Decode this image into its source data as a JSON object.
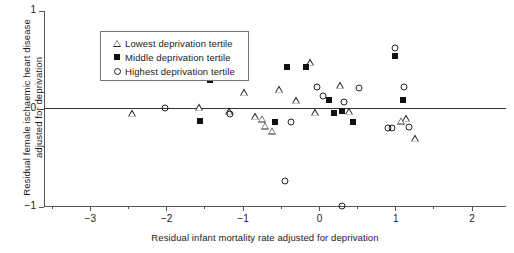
{
  "chart_data": {
    "type": "scatter",
    "title": "",
    "xlabel": "Residual infant mortality rate adjusted for deprivation",
    "ylabel_lines": [
      "Residual female ischaemic heart disease",
      "adjusted for deprivation"
    ],
    "ylabel": "Residual female ischaemic heart disease adjusted for deprivation",
    "xlim": [
      -3.6,
      2.45
    ],
    "ylim": [
      -1,
      1
    ],
    "xticks": [
      -3,
      -2,
      -1,
      0,
      1,
      2
    ],
    "xtick_labels": [
      "−3",
      "−2",
      "−1",
      "0",
      "1",
      "2"
    ],
    "xminor_ticks": [
      -3.5,
      -2.5,
      -1.5,
      -0.5,
      0.5,
      1.5
    ],
    "yticks": [
      1,
      0,
      -1
    ],
    "ytick_labels": [
      "1",
      "0",
      "−1"
    ],
    "grid": false,
    "zero_line": 0,
    "legend_position": "top-left",
    "series": [
      {
        "name": "Lowest deprivation tertile",
        "marker": "triangle-open",
        "color": "#222222",
        "points": [
          [
            -2.45,
            -0.04
          ],
          [
            -1.57,
            0.02
          ],
          [
            -1.18,
            -0.02
          ],
          [
            -0.98,
            0.17
          ],
          [
            -0.84,
            -0.07
          ],
          [
            -0.74,
            -0.1
          ],
          [
            -0.7,
            -0.17
          ],
          [
            -0.62,
            -0.22
          ],
          [
            -0.52,
            0.2
          ],
          [
            -0.3,
            0.09
          ],
          [
            -0.12,
            0.48
          ],
          [
            -0.05,
            -0.03
          ],
          [
            0.28,
            0.24
          ],
          [
            0.4,
            -0.02
          ],
          [
            1.08,
            -0.12
          ],
          [
            1.14,
            -0.09
          ],
          [
            1.26,
            -0.3
          ]
        ]
      },
      {
        "name": "Middle deprivation tertile",
        "marker": "square-filled",
        "color": "#111111",
        "points": [
          [
            -1.56,
            -0.12
          ],
          [
            -1.42,
            0.3
          ],
          [
            -1.13,
            0.35
          ],
          [
            -0.58,
            -0.13
          ],
          [
            -0.42,
            0.43
          ],
          [
            -0.17,
            0.43
          ],
          [
            0.13,
            0.09
          ],
          [
            0.2,
            -0.04
          ],
          [
            0.3,
            -0.02
          ],
          [
            0.44,
            -0.13
          ],
          [
            0.99,
            0.54
          ],
          [
            1.1,
            0.09
          ]
        ]
      },
      {
        "name": "Highest deprivation tertile",
        "marker": "circle-open",
        "color": "#222222",
        "points": [
          [
            -2.02,
            0.01
          ],
          [
            -1.17,
            -0.05
          ],
          [
            -0.36,
            -0.13
          ],
          [
            -0.45,
            -0.73
          ],
          [
            -0.02,
            0.22
          ],
          [
            0.06,
            0.13
          ],
          [
            0.33,
            0.07
          ],
          [
            0.3,
            -0.99
          ],
          [
            0.53,
            0.21
          ],
          [
            0.9,
            -0.19
          ],
          [
            0.96,
            -0.19
          ],
          [
            1.18,
            -0.18
          ],
          [
            0.99,
            0.62
          ],
          [
            1.12,
            0.22
          ]
        ]
      }
    ]
  },
  "legend": {
    "items": [
      {
        "label": "Lowest deprivation tertile",
        "symbol": "triangle-open"
      },
      {
        "label": "Middle deprivation tertile",
        "symbol": "square-filled"
      },
      {
        "label": "Highest deprivation tertile",
        "symbol": "circle-open"
      }
    ]
  }
}
